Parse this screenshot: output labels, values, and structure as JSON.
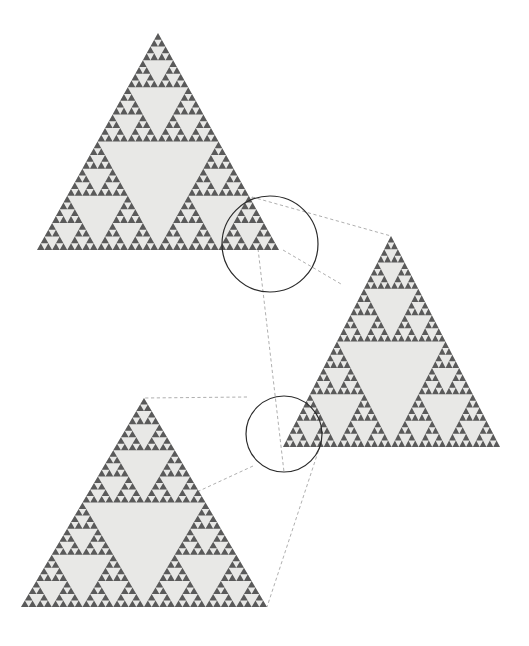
{
  "figure": {
    "background_color": "#ffffff",
    "fill_color": "#5a5a5a",
    "hole_color": "#e8e8e6",
    "circle_stroke": "#2b2b2b",
    "connector_stroke": "#9a9a9a",
    "connector_dash": "3.2 2.6"
  },
  "chart_data": {
    "type": "diagram",
    "xlabel": "",
    "ylabel": "",
    "shapes": [
      {
        "name": "sierpinski-triangle-top-left",
        "role": "primary-fractal",
        "depth": 5,
        "apex": [
          158,
          33
        ],
        "bottom_left": [
          37,
          250
        ],
        "bottom_right": [
          279,
          250
        ],
        "width": 242,
        "height": 217
      },
      {
        "name": "sierpinski-triangle-right",
        "role": "magnification-level-1",
        "depth": 5,
        "apex": [
          391,
          236
        ],
        "bottom_left": [
          283,
          447
        ],
        "bottom_right": [
          500,
          447
        ],
        "width": 217,
        "height": 211
      },
      {
        "name": "sierpinski-triangle-bottom-left",
        "role": "magnification-level-2",
        "depth": 5,
        "apex": [
          144,
          398
        ],
        "bottom_left": [
          21,
          607
        ],
        "bottom_right": [
          267,
          607
        ],
        "width": 246,
        "height": 209
      }
    ],
    "callouts": [
      {
        "name": "zoom-circle-1",
        "label": "",
        "center": [
          270,
          244
        ],
        "radius": 48,
        "source_shape": "sierpinski-triangle-top-left",
        "target_shape": "sierpinski-triangle-right"
      },
      {
        "name": "zoom-circle-2",
        "label": "",
        "center": [
          284,
          434
        ],
        "radius": 38,
        "source_shape": "sierpinski-triangle-right",
        "target_shape": "sierpinski-triangle-bottom-left"
      }
    ],
    "connectors": [
      {
        "name": "connector-1-upper",
        "from": [
          252,
          197
        ],
        "to": [
          391,
          236
        ]
      },
      {
        "name": "connector-1-lower",
        "from": [
          283,
          250
        ],
        "to": [
          341,
          284
        ]
      },
      {
        "name": "connector-1-diagonal",
        "from": [
          252,
          197
        ],
        "to": [
          284,
          472
        ]
      },
      {
        "name": "connector-2-upper",
        "from": [
          247,
          397
        ],
        "to": [
          144,
          398
        ]
      },
      {
        "name": "connector-2-lower",
        "from": [
          253,
          466
        ],
        "to": [
          199,
          491
        ]
      },
      {
        "name": "connector-2-diagonal",
        "from": [
          322,
          440
        ],
        "to": [
          267,
          607
        ]
      }
    ]
  }
}
